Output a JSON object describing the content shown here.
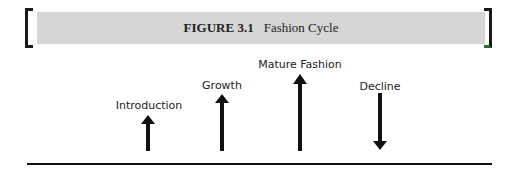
{
  "figure": {
    "number": "FIGURE 3.1",
    "title": "Fashion Cycle"
  },
  "stages": [
    {
      "label": "Introduction",
      "direction": "up"
    },
    {
      "label": "Growth",
      "direction": "up"
    },
    {
      "label": "Mature Fashion",
      "direction": "up"
    },
    {
      "label": "Decline",
      "direction": "down"
    }
  ]
}
